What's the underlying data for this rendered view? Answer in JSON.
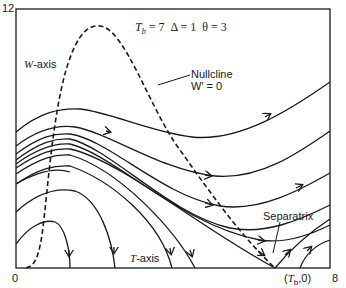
{
  "diagram": {
    "parameters": "T_b = 7  Δ = 1  θ = 3",
    "parameters_parts": {
      "tb_symbol": "T",
      "tb_sub": "b",
      "tb_value": "= 7",
      "delta": "Δ = 1",
      "theta": "θ = 3"
    },
    "y_axis_label": "W-axis",
    "y_axis_label_parts": {
      "var": "W",
      "rest": "-axis"
    },
    "x_axis_label": "T-axis",
    "x_axis_label_parts": {
      "var": "T",
      "rest": "-axis"
    },
    "y_tick_top": "12",
    "x_tick_left": "0",
    "x_tick_right": "8",
    "tb_point_label": "(T_b,0)",
    "tb_point_parts": {
      "open": "(",
      "var": "T",
      "sub": "b",
      "close": ",0)"
    },
    "nullcline_label_line1": "Nullcline",
    "nullcline_label_line2": "W′ = 0",
    "separatrix_label": "Separatrix",
    "colors": {
      "ink": "#1a1a1a",
      "background": "#ffffff"
    }
  }
}
